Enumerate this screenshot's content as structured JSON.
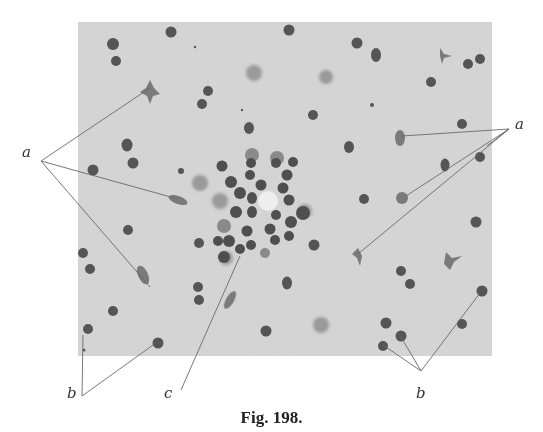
{
  "figure": {
    "caption": "Fig. 198.",
    "micrograph": {
      "x": 78,
      "y": 22,
      "width": 414,
      "height": 334,
      "background": "#d6d6d6",
      "cell_color": "#5a5a5a",
      "faint_cell_color": "#8a8a8a",
      "central_vessel": {
        "x": 269,
        "y": 201,
        "r": 10
      }
    },
    "labels": [
      {
        "id": "a-left",
        "text": "a",
        "x": 22,
        "y": 145
      },
      {
        "id": "a-right",
        "text": "a",
        "x": 515,
        "y": 117
      },
      {
        "id": "b-left",
        "text": "b",
        "x": 67,
        "y": 386
      },
      {
        "id": "c",
        "text": "c",
        "x": 164,
        "y": 386
      },
      {
        "id": "b-right",
        "text": "b",
        "x": 416,
        "y": 386
      }
    ],
    "leader_lines": [
      {
        "label": "a-left",
        "from": [
          41,
          161
        ],
        "to": [
          150,
          88
        ]
      },
      {
        "label": "a-left",
        "from": [
          41,
          161
        ],
        "to": [
          178,
          199
        ]
      },
      {
        "label": "a-left",
        "from": [
          41,
          161
        ],
        "to": [
          150,
          287
        ]
      },
      {
        "label": "a-right",
        "from": [
          509,
          129
        ],
        "to": [
          402,
          136
        ]
      },
      {
        "label": "a-right",
        "from": [
          509,
          129
        ],
        "to": [
          406,
          196
        ]
      },
      {
        "label": "a-right",
        "from": [
          509,
          129
        ],
        "to": [
          358,
          254
        ]
      },
      {
        "label": "b-left",
        "from": [
          82,
          396
        ],
        "to": [
          83,
          335
        ]
      },
      {
        "label": "b-left",
        "from": [
          82,
          396
        ],
        "to": [
          153,
          345
        ]
      },
      {
        "label": "c",
        "from": [
          181,
          390
        ],
        "to": [
          240,
          256
        ]
      },
      {
        "label": "b-right",
        "from": [
          421,
          371
        ],
        "to": [
          383,
          345
        ]
      },
      {
        "label": "b-right",
        "from": [
          421,
          371
        ],
        "to": [
          401,
          337
        ]
      },
      {
        "label": "b-right",
        "from": [
          421,
          371
        ],
        "to": [
          480,
          293
        ]
      }
    ]
  }
}
